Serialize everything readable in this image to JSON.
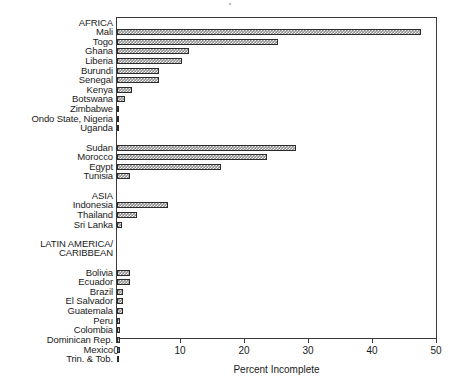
{
  "chart_data": {
    "type": "bar",
    "orientation": "horizontal",
    "title": "",
    "xlabel": "Percent Incomplete",
    "ylabel": "",
    "xlim": [
      0,
      50
    ],
    "xticks": [
      0,
      10,
      20,
      30,
      40,
      50
    ],
    "xtick_labels": [
      "0",
      "10",
      "20",
      "30",
      "40",
      "50"
    ],
    "grid": false,
    "legend": null,
    "categories": [
      "AFRICA",
      "Mali",
      "Togo",
      "Ghana",
      "Liberia",
      "Burundi",
      "Senegal",
      "Kenya",
      "Botswana",
      "Zimbabwe",
      "Ondo State, Nigeria",
      "Uganda",
      "",
      "Sudan",
      "Morocco",
      "Egypt",
      "Tunisia",
      "",
      "ASIA",
      "Indonesia",
      "Thailand",
      "Sri Lanka",
      "",
      "LATIN AMERICA/",
      "CARIBBEAN",
      "",
      "Bolivia",
      "Ecuador",
      "Brazil",
      "El Salvador",
      "Guatemala",
      "Peru",
      "Colombia",
      "Dominican Rep.",
      "Mexico",
      "Trin. & Tob."
    ],
    "values": [
      null,
      47.5,
      25.1,
      11.3,
      10.2,
      6.6,
      6.5,
      2.4,
      1.2,
      0.3,
      0.0,
      0.0,
      null,
      28.0,
      23.5,
      16.2,
      2.0,
      null,
      null,
      7.9,
      3.1,
      0.8,
      null,
      null,
      null,
      null,
      2.1,
      2.0,
      1.0,
      1.0,
      1.0,
      0.5,
      0.5,
      0.5,
      0.5,
      0.2
    ],
    "group_headers": [
      "AFRICA",
      "ASIA",
      "LATIN AMERICA/",
      "CARIBBEAN"
    ]
  },
  "axis": {
    "x_title": "Percent Incomplete"
  }
}
